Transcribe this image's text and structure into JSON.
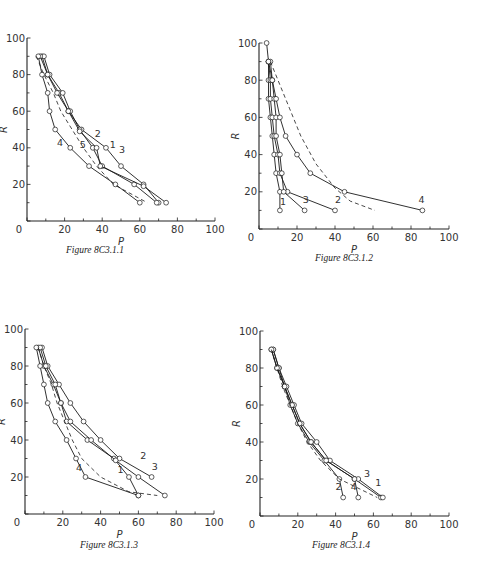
{
  "chart_data": [
    {
      "id": "8C3.1.1",
      "type": "line",
      "title": "Figure 8C3.1.1",
      "xlabel": "P",
      "ylabel": "R",
      "xlim": [
        0,
        100
      ],
      "ylim": [
        0,
        100
      ],
      "xticks": [
        0,
        20,
        40,
        60,
        80,
        100
      ],
      "yticks": [
        0,
        20,
        40,
        60,
        80,
        100
      ],
      "grid": false,
      "legend": "numeric labels at curve ends",
      "series": [
        {
          "name": "1",
          "label_pos": [
            44,
            40
          ],
          "dashed": false,
          "points": [
            [
              8,
              90
            ],
            [
              11,
              80
            ],
            [
              17,
              70
            ],
            [
              22,
              60
            ],
            [
              29,
              50
            ],
            [
              42,
              40
            ],
            [
              50,
              30
            ],
            [
              62,
              20
            ],
            [
              70,
              10
            ]
          ]
        },
        {
          "name": "2",
          "label_pos": [
            36,
            46
          ],
          "dashed": false,
          "points": [
            [
              9,
              90
            ],
            [
              12,
              80
            ],
            [
              19,
              70
            ],
            [
              23,
              60
            ],
            [
              28,
              50
            ],
            [
              35,
              40
            ],
            [
              40,
              30
            ],
            [
              57,
              20
            ],
            [
              69,
              10
            ]
          ]
        },
        {
          "name": "3",
          "label_pos": [
            49,
            37
          ],
          "dashed": false,
          "points": [
            [
              7,
              90
            ],
            [
              11,
              80
            ],
            [
              16,
              70
            ],
            [
              22,
              60
            ],
            [
              28,
              49
            ],
            [
              37,
              40
            ],
            [
              39,
              30
            ],
            [
              62,
              19
            ],
            [
              74,
              10
            ]
          ]
        },
        {
          "name": "4",
          "label_pos": [
            16,
            41
          ],
          "dashed": false,
          "points": [
            [
              6,
              90
            ],
            [
              8,
              80
            ],
            [
              11,
              70
            ],
            [
              12,
              60
            ],
            [
              15,
              50
            ],
            [
              23,
              40
            ],
            [
              33,
              30
            ],
            [
              47,
              20
            ],
            [
              60,
              10
            ]
          ]
        },
        {
          "name": "5",
          "label_pos": [
            28,
            40
          ],
          "dashed": true,
          "points": [
            [
              5,
              90
            ],
            [
              9,
              80
            ],
            [
              14,
              70
            ],
            [
              18,
              60
            ],
            [
              24,
              50
            ],
            [
              30,
              40
            ],
            [
              37,
              30
            ],
            [
              46,
              20
            ],
            [
              64,
              10
            ]
          ]
        }
      ]
    },
    {
      "id": "8C3.1.2",
      "type": "line",
      "title": "Figure 8C3.1.2",
      "xlabel": "P",
      "ylabel": "R",
      "xlim": [
        0,
        100
      ],
      "ylim": [
        0,
        100
      ],
      "xticks": [
        0,
        20,
        40,
        60,
        80,
        100
      ],
      "yticks": [
        0,
        20,
        40,
        60,
        80,
        100
      ],
      "grid": false,
      "legend": "numeric labels at curve ends",
      "series": [
        {
          "name": "1",
          "label_pos": [
            11,
            13
          ],
          "dashed": false,
          "points": [
            [
              4,
              100
            ],
            [
              5,
              90
            ],
            [
              5,
              80
            ],
            [
              5,
              70
            ],
            [
              6,
              60
            ],
            [
              7,
              50
            ],
            [
              8,
              40
            ],
            [
              9,
              30
            ],
            [
              11,
              20
            ],
            [
              11,
              10
            ]
          ]
        },
        {
          "name": "2",
          "label_pos": [
            40,
            14
          ],
          "dashed": false,
          "points": [
            [
              5,
              90
            ],
            [
              6,
              80
            ],
            [
              6,
              70
            ],
            [
              7,
              60
            ],
            [
              8,
              50
            ],
            [
              10,
              40
            ],
            [
              11,
              30
            ],
            [
              15,
              20
            ],
            [
              40,
              10
            ]
          ]
        },
        {
          "name": "3",
          "label_pos": [
            23,
            14
          ],
          "dashed": false,
          "points": [
            [
              6,
              90
            ],
            [
              7,
              80
            ],
            [
              8,
              70
            ],
            [
              9,
              60
            ],
            [
              9,
              50
            ],
            [
              11,
              40
            ],
            [
              12,
              30
            ],
            [
              13,
              20
            ],
            [
              24,
              10
            ]
          ]
        },
        {
          "name": "4",
          "label_pos": [
            84,
            14
          ],
          "dashed": false,
          "points": [
            [
              5,
              90
            ],
            [
              7,
              80
            ],
            [
              9,
              70
            ],
            [
              11,
              60
            ],
            [
              14,
              50
            ],
            [
              20,
              40
            ],
            [
              27,
              30
            ],
            [
              45,
              20
            ],
            [
              86,
              10
            ]
          ]
        },
        {
          "name": "dashed",
          "dashed": true,
          "points": [
            [
              6,
              90
            ],
            [
              10,
              80
            ],
            [
              16,
              65
            ],
            [
              22,
              50
            ],
            [
              30,
              35
            ],
            [
              40,
              22
            ],
            [
              48,
              15
            ],
            [
              61,
              10
            ]
          ]
        }
      ]
    },
    {
      "id": "8C3.1.3",
      "type": "line",
      "title": "Figure 8C3.1.3",
      "xlabel": "P",
      "ylabel": "R",
      "xlim": [
        0,
        100
      ],
      "ylim": [
        0,
        100
      ],
      "xticks": [
        0,
        20,
        40,
        60,
        80,
        100
      ],
      "yticks": [
        0,
        20,
        40,
        60,
        80,
        100
      ],
      "grid": false,
      "legend": "numeric labels at curve ends",
      "series": [
        {
          "name": "1",
          "label_pos": [
            49,
            22
          ],
          "dashed": false,
          "points": [
            [
              7,
              90
            ],
            [
              10,
              80
            ],
            [
              15,
              70
            ],
            [
              19,
              60
            ],
            [
              22,
              50
            ],
            [
              33,
              40
            ],
            [
              47,
              30
            ],
            [
              55,
              20
            ],
            [
              60,
              10
            ]
          ]
        },
        {
          "name": "2",
          "label_pos": [
            61,
            30
          ],
          "dashed": false,
          "points": [
            [
              9,
              90
            ],
            [
              12,
              80
            ],
            [
              18,
              70
            ],
            [
              24,
              60
            ],
            [
              31,
              50
            ],
            [
              40,
              40
            ],
            [
              50,
              30
            ],
            [
              67,
              20
            ]
          ]
        },
        {
          "name": "3",
          "label_pos": [
            67,
            24
          ],
          "dashed": false,
          "points": [
            [
              8,
              90
            ],
            [
              11,
              80
            ],
            [
              16,
              70
            ],
            [
              19,
              60
            ],
            [
              24,
              50
            ],
            [
              35,
              40
            ],
            [
              48,
              29
            ],
            [
              60,
              20
            ],
            [
              74,
              10
            ]
          ]
        },
        {
          "name": "4",
          "label_pos": [
            27,
            23
          ],
          "dashed": false,
          "points": [
            [
              6,
              90
            ],
            [
              8,
              80
            ],
            [
              10,
              70
            ],
            [
              12,
              60
            ],
            [
              16,
              50
            ],
            [
              22,
              40
            ],
            [
              27,
              30
            ],
            [
              32,
              20
            ],
            [
              60,
              10
            ]
          ]
        },
        {
          "name": "dashed",
          "dashed": true,
          "points": [
            [
              7,
              90
            ],
            [
              10,
              80
            ],
            [
              14,
              70
            ],
            [
              17,
              60
            ],
            [
              21,
              50
            ],
            [
              25,
              40
            ],
            [
              30,
              30
            ],
            [
              40,
              20
            ],
            [
              55,
              12
            ],
            [
              70,
              10
            ]
          ]
        }
      ]
    },
    {
      "id": "8C3.1.4",
      "type": "line",
      "title": "Figure 8C3.1.4",
      "xlabel": "P",
      "ylabel": "R",
      "xlim": [
        0,
        100
      ],
      "ylim": [
        0,
        100
      ],
      "xticks": [
        0,
        20,
        40,
        60,
        80,
        100
      ],
      "yticks": [
        0,
        20,
        40,
        60,
        80,
        100
      ],
      "grid": false,
      "legend": "numeric labels at curve ends",
      "series": [
        {
          "name": "1",
          "label_pos": [
            61,
            16
          ],
          "dashed": false,
          "points": [
            [
              7,
              90
            ],
            [
              10,
              80
            ],
            [
              13,
              70
            ],
            [
              17,
              60
            ],
            [
              21,
              50
            ],
            [
              27,
              40
            ],
            [
              35,
              30
            ],
            [
              50,
              20
            ],
            [
              64,
              10
            ]
          ]
        },
        {
          "name": "2",
          "label_pos": [
            40,
            14
          ],
          "dashed": false,
          "points": [
            [
              6,
              90
            ],
            [
              9,
              80
            ],
            [
              13,
              70
            ],
            [
              16,
              60
            ],
            [
              20,
              50
            ],
            [
              26,
              40
            ],
            [
              34,
              30
            ],
            [
              42,
              20
            ],
            [
              44,
              10
            ]
          ]
        },
        {
          "name": "3",
          "label_pos": [
            55,
            21
          ],
          "dashed": false,
          "points": [
            [
              7,
              90
            ],
            [
              10,
              80
            ],
            [
              14,
              70
            ],
            [
              18,
              60
            ],
            [
              22,
              50
            ],
            [
              30,
              40
            ],
            [
              37,
              30
            ],
            [
              52,
              20
            ],
            [
              65,
              10
            ]
          ]
        },
        {
          "name": "4",
          "label_pos": [
            48,
            14
          ],
          "dashed": false,
          "points": [
            [
              6,
              90
            ],
            [
              9,
              80
            ],
            [
              13,
              70
            ],
            [
              17,
              60
            ],
            [
              21,
              50
            ],
            [
              27,
              40
            ],
            [
              35,
              30
            ],
            [
              50,
              20
            ],
            [
              52,
              10
            ]
          ]
        },
        {
          "name": "dashed",
          "dashed": true,
          "points": [
            [
              6,
              90
            ],
            [
              9,
              80
            ],
            [
              12,
              70
            ],
            [
              16,
              60
            ],
            [
              20,
              50
            ],
            [
              25,
              40
            ],
            [
              32,
              30
            ],
            [
              42,
              20
            ],
            [
              62,
              10
            ]
          ]
        }
      ]
    }
  ],
  "panels": [
    {
      "caption": "Figure 8C3.1.1",
      "xlabel": "P",
      "ylabel": "R"
    },
    {
      "caption": "Figure 8C3.1.2",
      "xlabel": "P",
      "ylabel": "R"
    },
    {
      "caption": "Figure 8C3.1.3",
      "xlabel": "P",
      "ylabel": "R"
    },
    {
      "caption": "Figure 8C3.1.4",
      "xlabel": "P",
      "ylabel": "R"
    }
  ],
  "layout": [
    {
      "ox": 27,
      "oy": 221,
      "w": 188,
      "h": 183,
      "cap_x": 66,
      "cap_y": 254
    },
    {
      "ox": 259,
      "oy": 229,
      "w": 190,
      "h": 186,
      "cap_x": 315,
      "cap_y": 262
    },
    {
      "ox": 25,
      "oy": 514,
      "w": 189,
      "h": 185,
      "cap_x": 80,
      "cap_y": 549
    },
    {
      "ox": 260,
      "oy": 516,
      "w": 189,
      "h": 185,
      "cap_x": 312,
      "cap_y": 549
    }
  ],
  "style": {
    "line_color": "#1a1a1a",
    "marker_fill": "#ffffff",
    "axis_color": "#222222",
    "text_color": "#333333"
  }
}
